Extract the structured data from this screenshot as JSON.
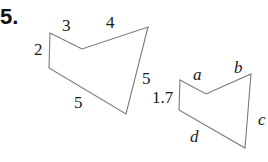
{
  "problem": {
    "number": "5."
  },
  "figures": [
    {
      "name": "large-pentagon",
      "vertices": [
        [
          50,
          33
        ],
        [
          82,
          49
        ],
        [
          148,
          27
        ],
        [
          126,
          114
        ],
        [
          49,
          68
        ]
      ],
      "side_labels": {
        "left": "2",
        "top_left": "3",
        "top_right": "4",
        "right": "5",
        "bottom": "5"
      }
    },
    {
      "name": "small-pentagon",
      "vertices": [
        [
          180,
          80
        ],
        [
          206,
          94
        ],
        [
          251,
          74
        ],
        [
          245,
          148
        ],
        [
          179,
          110
        ]
      ],
      "side_labels": {
        "left": "1.7",
        "top_left": "a",
        "top_right": "b",
        "right": "c",
        "bottom": "d"
      }
    }
  ],
  "colors": {
    "stroke": "#7a7a7a",
    "text": "#1a1a1a"
  }
}
